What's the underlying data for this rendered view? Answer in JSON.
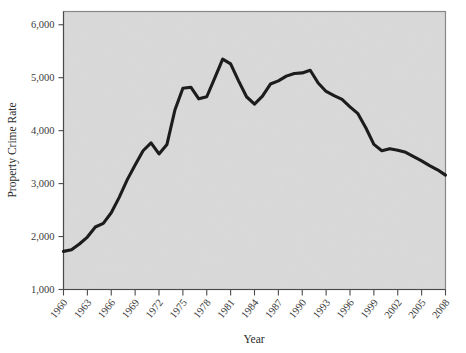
{
  "figure": {
    "plot_background_color": "#d9d9d9",
    "page_background_color": "#ffffff",
    "line_color": "#1c1c1c",
    "axis_color": "#4a4a4a",
    "x_axis_title": "Year",
    "y_axis_title": "Property Crime Rate"
  },
  "chart_data": {
    "type": "line",
    "title": "",
    "xlabel": "Year",
    "ylabel": "Property Crime Rate",
    "xlim": [
      1960,
      2008
    ],
    "ylim": [
      1000,
      6250
    ],
    "grid": false,
    "legend": "none",
    "xticks": [
      "1960",
      "1963",
      "1966",
      "1969",
      "1972",
      "1975",
      "1978",
      "1981",
      "1984",
      "1987",
      "1990",
      "1993",
      "1996",
      "1999",
      "2002",
      "2005",
      "2008"
    ],
    "yticks": [
      "1,000",
      "2,000",
      "3,000",
      "4,000",
      "5,000",
      "6,000"
    ],
    "series": [
      {
        "name": "Property Crime Rate",
        "color": "#1c1c1c",
        "x": [
          1960,
          1961,
          1962,
          1963,
          1964,
          1965,
          1966,
          1967,
          1968,
          1969,
          1970,
          1971,
          1972,
          1973,
          1974,
          1975,
          1976,
          1977,
          1978,
          1979,
          1980,
          1981,
          1982,
          1983,
          1984,
          1985,
          1986,
          1987,
          1988,
          1989,
          1990,
          1991,
          1992,
          1993,
          1994,
          1995,
          1996,
          1997,
          1998,
          1999,
          2000,
          2001,
          2002,
          2003,
          2004,
          2005,
          2006,
          2007,
          2008
        ],
        "y": [
          1720,
          1750,
          1860,
          1990,
          2180,
          2250,
          2450,
          2740,
          3070,
          3350,
          3620,
          3770,
          3560,
          3740,
          4390,
          4800,
          4820,
          4600,
          4640,
          4990,
          5350,
          5260,
          4940,
          4640,
          4500,
          4650,
          4880,
          4940,
          5030,
          5080,
          5090,
          5140,
          4900,
          4740,
          4660,
          4590,
          4450,
          4320,
          4050,
          3740,
          3620,
          3660,
          3630,
          3590,
          3510,
          3430,
          3340,
          3260,
          3160
        ]
      }
    ]
  }
}
